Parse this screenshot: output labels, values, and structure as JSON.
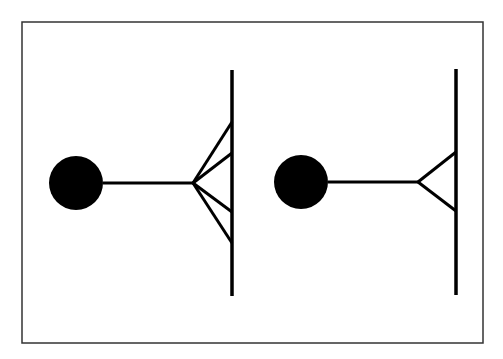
{
  "canvas": {
    "width": 503,
    "height": 359,
    "background": "#ffffff"
  },
  "frame": {
    "x": 22,
    "y": 22,
    "width": 461,
    "height": 321,
    "stroke": "#333333",
    "stroke_width": 1.5
  },
  "colors": {
    "ink": "#000000"
  },
  "figures": [
    {
      "name": "multi-contact-figure",
      "circle": {
        "cx": 76,
        "cy": 183,
        "r": 27
      },
      "stem": {
        "x1": 103,
        "y1": 183,
        "x2": 193,
        "y2": 183
      },
      "apex": {
        "x": 193,
        "y": 183
      },
      "branch_ends_y": [
        122,
        153,
        212,
        243
      ],
      "wall": {
        "x": 232,
        "y1": 70,
        "y2": 296
      }
    },
    {
      "name": "single-contact-figure",
      "circle": {
        "cx": 301,
        "cy": 182,
        "r": 27
      },
      "stem": {
        "x1": 328,
        "y1": 182,
        "x2": 418,
        "y2": 182
      },
      "apex": {
        "x": 418,
        "y": 182
      },
      "branch_ends_y": [
        152,
        211
      ],
      "wall": {
        "x": 456,
        "y1": 69,
        "y2": 295
      }
    }
  ]
}
